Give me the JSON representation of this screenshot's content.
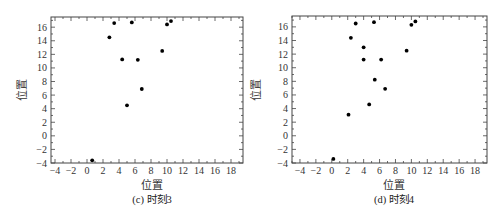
{
  "chart_data": [
    {
      "type": "scatter",
      "caption": "(c) 时刻3",
      "xlabel": "位置",
      "ylabel": "位置",
      "xlim": [
        -4.5,
        19.5
      ],
      "ylim": [
        -4,
        17.5
      ],
      "xticks": [
        -4,
        -2,
        0,
        2,
        4,
        6,
        8,
        10,
        12,
        14,
        16,
        18
      ],
      "yticks": [
        -4,
        -2,
        0,
        2,
        4,
        6,
        8,
        10,
        12,
        14,
        16
      ],
      "grid": false,
      "legend": null,
      "marker_color": "#000000",
      "points": [
        {
          "x": 3.4,
          "y": 16.6
        },
        {
          "x": 5.6,
          "y": 16.7
        },
        {
          "x": 10.0,
          "y": 16.4
        },
        {
          "x": 10.5,
          "y": 16.9
        },
        {
          "x": 2.8,
          "y": 14.5
        },
        {
          "x": 9.4,
          "y": 12.5
        },
        {
          "x": 4.4,
          "y": 11.25
        },
        {
          "x": 6.35,
          "y": 11.2
        },
        {
          "x": 6.85,
          "y": 6.9
        },
        {
          "x": 5.0,
          "y": 4.5
        },
        {
          "x": 0.65,
          "y": -3.6
        }
      ],
      "box": {
        "left": 51,
        "top": 17,
        "right": 243,
        "bottom": 163
      }
    },
    {
      "type": "scatter",
      "caption": "(d) 时刻4",
      "xlabel": "位置",
      "ylabel": "位置",
      "xlim": [
        -5,
        19.5
      ],
      "ylim": [
        -4,
        17.6
      ],
      "xticks": [
        -4,
        -2,
        0,
        2,
        4,
        6,
        8,
        10,
        12,
        14,
        16,
        18
      ],
      "yticks": [
        -4,
        -2,
        0,
        2,
        4,
        6,
        8,
        10,
        12,
        14,
        16
      ],
      "grid": false,
      "legend": null,
      "marker_color": "#000000",
      "points": [
        {
          "x": 3.0,
          "y": 16.5
        },
        {
          "x": 5.3,
          "y": 16.7
        },
        {
          "x": 10.0,
          "y": 16.3
        },
        {
          "x": 10.5,
          "y": 16.8
        },
        {
          "x": 2.4,
          "y": 14.4
        },
        {
          "x": 9.4,
          "y": 12.5
        },
        {
          "x": 4.0,
          "y": 13.0
        },
        {
          "x": 4.0,
          "y": 11.2
        },
        {
          "x": 6.2,
          "y": 11.2
        },
        {
          "x": 5.4,
          "y": 8.25
        },
        {
          "x": 6.7,
          "y": 6.9
        },
        {
          "x": 4.7,
          "y": 4.6
        },
        {
          "x": 2.1,
          "y": 3.1
        },
        {
          "x": 0.2,
          "y": -3.4
        }
      ],
      "box": {
        "left": 292,
        "top": 16,
        "right": 487,
        "bottom": 163
      }
    }
  ],
  "panels": {
    "left": {
      "caption": "(c) 时刻3",
      "xlabel": "位置",
      "ylabel": "位置"
    },
    "right": {
      "caption": "(d) 时刻4",
      "xlabel": "位置",
      "ylabel": "位置"
    }
  }
}
